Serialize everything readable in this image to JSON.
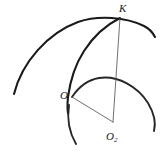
{
  "figure": {
    "type": "geometry-diagram",
    "width": 167,
    "height": 152,
    "background_color": "#ffffff",
    "stroke_color": "#1a1a1a",
    "thin_stroke_color": "#555555",
    "labels": {
      "k": "K",
      "o": "O",
      "o2_base": "O",
      "o2_subscript": "2"
    },
    "points": [
      {
        "name": "K",
        "label": "K",
        "x": 120,
        "y": 18
      },
      {
        "name": "O",
        "label": "O",
        "x": 72,
        "y": 97
      },
      {
        "name": "O2",
        "label": "O2",
        "x": 113,
        "y": 122
      }
    ],
    "arcs": [
      {
        "name": "large-outer-arc",
        "description": "large thick arc sweeping from lower-left up over the top and down to the right, passing through K",
        "start": {
          "x": 14,
          "y": 94
        },
        "end": {
          "x": 155,
          "y": 37
        },
        "apex": {
          "x": 96,
          "y": 16
        }
      },
      {
        "name": "middle-arc",
        "description": "thick arc from K curving down-left through O",
        "start": {
          "x": 120,
          "y": 18
        },
        "end": {
          "x": 68,
          "y": 113
        },
        "through": {
          "x": 82,
          "y": 53
        }
      },
      {
        "name": "small-circle-arc",
        "description": "thick arc of the circle centred at O2 passing through O, over the top and down the right side",
        "center": {
          "x": 113,
          "y": 122
        },
        "radius": 45,
        "start": {
          "x": 72,
          "y": 97
        },
        "end": {
          "x": 154,
          "y": 131
        }
      }
    ],
    "segments": [
      {
        "name": "segment-K-O2",
        "from": "K",
        "to": "O2",
        "from_point": {
          "x": 120,
          "y": 18
        },
        "to_point": {
          "x": 113,
          "y": 122
        },
        "style": "thin"
      },
      {
        "name": "segment-O-O2",
        "from": "O",
        "to": "O2",
        "from_point": {
          "x": 72,
          "y": 97
        },
        "to_point": {
          "x": 113,
          "y": 122
        },
        "style": "thin"
      }
    ]
  }
}
